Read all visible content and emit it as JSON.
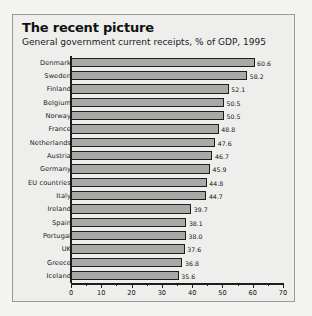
{
  "chart_data": {
    "type": "bar",
    "orientation": "horizontal",
    "title": "The recent picture",
    "subtitle": "General government current receipts, % of GDP, 1995",
    "xlabel": "",
    "ylabel": "",
    "xlim": [
      0,
      70
    ],
    "xticks": [
      0,
      10,
      20,
      30,
      40,
      50,
      60,
      70
    ],
    "xtick_labels": [
      "0",
      "10",
      "20",
      "30",
      "40",
      "50",
      "60",
      "70"
    ],
    "minor_tick_step": 5,
    "grid": false,
    "legend": null,
    "bar_color": "#a9a9a7",
    "bar_edge_color": "#1d1d1d",
    "categories": [
      "Denmark",
      "Sweden",
      "Finland",
      "Belgium",
      "Norway",
      "France",
      "Netherlands",
      "Austria",
      "Germany",
      "EU countries",
      "Italy",
      "Ireland",
      "Spain",
      "Portugal",
      "UK",
      "Greece",
      "Iceland"
    ],
    "values": [
      60.6,
      58.2,
      52.1,
      50.5,
      50.5,
      48.8,
      47.6,
      46.7,
      45.9,
      44.8,
      44.7,
      39.7,
      38.1,
      38.0,
      37.6,
      36.8,
      35.6
    ],
    "value_labels": [
      "60.6",
      "58.2",
      "52.1",
      "50.5",
      "50.5",
      "48.8",
      "47.6",
      "46.7",
      "45.9",
      "44.8",
      "44.7",
      "39.7",
      "38.1",
      "38.0",
      "37.6",
      "36.8",
      "35.6"
    ]
  },
  "panel": {
    "background": "#eeeeec",
    "border_color": "#9a9a96"
  }
}
